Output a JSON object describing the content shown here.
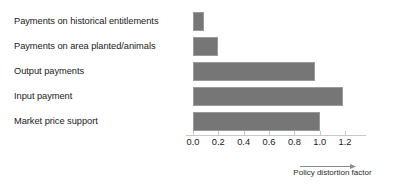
{
  "chart_data": {
    "type": "bar",
    "orientation": "horizontal",
    "title": "",
    "xlabel": "Policy distortion factor",
    "ylabel": "",
    "categories": [
      "Payments on historical entitlements",
      "Payments on area planted/animals",
      "Output payments",
      "Input payment",
      "Market price support"
    ],
    "values": [
      0.09,
      0.2,
      0.96,
      1.18,
      1.0
    ],
    "xlim": [
      0.0,
      1.3
    ],
    "xticks": [
      0.0,
      0.2,
      0.4,
      0.6,
      0.8,
      1.0,
      1.2
    ],
    "xtick_labels": [
      "0.0",
      "0.2",
      "0.4",
      "0.6",
      "0.8",
      "1.0",
      "1.2"
    ],
    "grid": false,
    "legend": "none",
    "bar_color": "#767676",
    "bar_border_color": "#9a9a9a",
    "axis_color": "#c8c8c8",
    "text_color": "#1a1a1a",
    "background": "#ffffff"
  },
  "annotations": {
    "axis_caption": "Policy distortion factor",
    "arrow_icon": "right-arrow-icon"
  }
}
